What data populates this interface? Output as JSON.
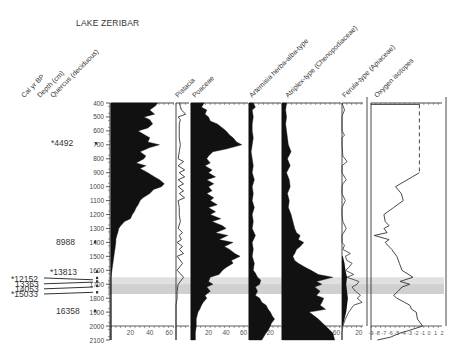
{
  "title": "LAKE ZERIBAR",
  "chart_data": {
    "type": "area",
    "title": "LAKE ZERIBAR",
    "subtitle": "Pollen percentage diagram with oxygen isotopes",
    "y_axis": {
      "label": "Depth (cm)",
      "range": [
        400,
        2100
      ],
      "ticks": [
        400,
        500,
        600,
        700,
        800,
        900,
        1000,
        1100,
        1200,
        1300,
        1400,
        1500,
        1600,
        1700,
        1800,
        1900,
        2000,
        2100
      ],
      "inverted": true
    },
    "age_axis": {
      "label": "Cal yr BP",
      "dates": [
        {
          "label": "*4492",
          "depth": 690
        },
        {
          "label": "8988",
          "depth": 1395
        },
        {
          "label": "*13813",
          "depth": 1610
        },
        {
          "label": "*12152",
          "depth": 1660
        },
        {
          "label": "13363",
          "depth": 1690
        },
        {
          "label": "14053",
          "depth": 1735
        },
        {
          "label": "*15033",
          "depth": 1790
        },
        {
          "label": "16358",
          "depth": 1890
        }
      ]
    },
    "highlight_band": {
      "depth_from": 1650,
      "depth_to": 1770,
      "color": "#d8d8d8"
    },
    "series": [
      {
        "name": "Quercus (deciduous)",
        "kind": "silhouette",
        "xlim": [
          0,
          65
        ],
        "xticks": [
          20,
          40,
          60
        ],
        "depth": [
          400,
          420,
          450,
          480,
          500,
          520,
          550,
          580,
          600,
          630,
          650,
          680,
          700,
          720,
          750,
          780,
          800,
          830,
          850,
          870,
          900,
          930,
          950,
          980,
          1000,
          1020,
          1050,
          1080,
          1100,
          1130,
          1150,
          1180,
          1200,
          1230,
          1250,
          1280,
          1300,
          1330,
          1350,
          1380,
          1400,
          1450,
          1500,
          1550,
          1600,
          1650,
          1700,
          1750,
          1800,
          1850,
          1900,
          1950,
          2000,
          2050,
          2100
        ],
        "values": [
          48,
          46,
          40,
          45,
          34,
          40,
          43,
          38,
          28,
          35,
          40,
          38,
          50,
          40,
          30,
          36,
          34,
          26,
          36,
          30,
          38,
          45,
          50,
          55,
          52,
          44,
          40,
          33,
          30,
          28,
          26,
          24,
          22,
          20,
          14,
          10,
          8,
          7,
          6,
          5,
          5,
          4,
          3,
          2,
          1,
          0,
          0,
          0,
          0,
          0,
          0,
          0,
          0,
          0,
          0
        ]
      },
      {
        "name": "Pistacia",
        "kind": "line",
        "xlim": [
          0,
          12
        ],
        "depth": [
          400,
          450,
          480,
          500,
          520,
          550,
          600,
          650,
          700,
          750,
          800,
          820,
          850,
          880,
          900,
          930,
          950,
          980,
          1000,
          1030,
          1050,
          1080,
          1100,
          1150,
          1200,
          1250,
          1300,
          1330,
          1350,
          1380,
          1400,
          1430,
          1450,
          1480,
          1500,
          1550,
          1600,
          1650,
          1700,
          1750,
          1800,
          1850,
          1900,
          1950,
          2000,
          2100
        ],
        "values": [
          3,
          5,
          9,
          2,
          4,
          3,
          3,
          3,
          4,
          3,
          2,
          7,
          2,
          8,
          3,
          8,
          2,
          7,
          2,
          7,
          3,
          8,
          2,
          3,
          3,
          4,
          2,
          6,
          3,
          5,
          1,
          6,
          3,
          7,
          1,
          6,
          1,
          7,
          2,
          1,
          1,
          0,
          0,
          0,
          0,
          0
        ]
      },
      {
        "name": "Poaceae",
        "kind": "silhouette",
        "xlim": [
          0,
          65
        ],
        "xticks": [
          20,
          40,
          60
        ],
        "depth": [
          400,
          430,
          450,
          480,
          500,
          530,
          550,
          580,
          600,
          630,
          650,
          680,
          700,
          730,
          750,
          780,
          800,
          830,
          850,
          880,
          900,
          930,
          950,
          980,
          1000,
          1030,
          1050,
          1080,
          1100,
          1130,
          1150,
          1180,
          1200,
          1230,
          1250,
          1280,
          1300,
          1330,
          1350,
          1380,
          1400,
          1430,
          1450,
          1480,
          1500,
          1530,
          1550,
          1580,
          1600,
          1630,
          1650,
          1680,
          1700,
          1720,
          1750,
          1780,
          1800,
          1830,
          1850,
          1880,
          1900,
          1950,
          2000,
          2050,
          2100
        ],
        "values": [
          15,
          12,
          18,
          16,
          20,
          22,
          30,
          36,
          40,
          44,
          48,
          52,
          58,
          40,
          25,
          20,
          18,
          22,
          16,
          24,
          20,
          28,
          18,
          26,
          20,
          24,
          18,
          26,
          22,
          30,
          20,
          28,
          22,
          34,
          24,
          36,
          40,
          28,
          42,
          32,
          48,
          38,
          44,
          50,
          56,
          46,
          48,
          40,
          36,
          32,
          22,
          20,
          25,
          18,
          22,
          16,
          18,
          14,
          12,
          10,
          8,
          6,
          6,
          5,
          5
        ]
      },
      {
        "name": "Artemisia herba-alba-type",
        "kind": "silhouette",
        "xlim": [
          0,
          30
        ],
        "xticks": [
          20
        ],
        "depth": [
          400,
          430,
          450,
          500,
          550,
          600,
          650,
          700,
          750,
          800,
          850,
          900,
          950,
          1000,
          1050,
          1100,
          1150,
          1200,
          1250,
          1300,
          1350,
          1400,
          1450,
          1500,
          1550,
          1600,
          1620,
          1650,
          1670,
          1700,
          1720,
          1750,
          1780,
          1800,
          1830,
          1850,
          1880,
          1900,
          1930,
          1950,
          1980,
          2000,
          2030,
          2050,
          2100
        ],
        "values": [
          4,
          6,
          3,
          4,
          3,
          3,
          4,
          3,
          2,
          3,
          4,
          3,
          5,
          3,
          4,
          3,
          5,
          3,
          4,
          3,
          6,
          3,
          4,
          3,
          5,
          4,
          6,
          8,
          11,
          10,
          6,
          8,
          6,
          10,
          12,
          16,
          18,
          20,
          22,
          24,
          21,
          20,
          18,
          16,
          12
        ]
      },
      {
        "name": "Atriplex-type (Chenopodiaceae)",
        "kind": "silhouette",
        "xlim": [
          0,
          65
        ],
        "xticks": [
          20,
          40,
          60
        ],
        "depth": [
          400,
          450,
          500,
          550,
          600,
          650,
          700,
          750,
          800,
          850,
          900,
          950,
          1000,
          1050,
          1100,
          1150,
          1200,
          1250,
          1300,
          1330,
          1350,
          1380,
          1400,
          1430,
          1450,
          1480,
          1500,
          1530,
          1550,
          1580,
          1600,
          1630,
          1650,
          1680,
          1700,
          1720,
          1750,
          1780,
          1800,
          1830,
          1850,
          1880,
          1900,
          1950,
          2000,
          2050,
          2100
        ],
        "values": [
          5,
          4,
          5,
          4,
          5,
          6,
          7,
          10,
          6,
          9,
          5,
          8,
          9,
          6,
          8,
          7,
          10,
          12,
          14,
          16,
          20,
          18,
          24,
          20,
          16,
          14,
          12,
          14,
          18,
          26,
          32,
          40,
          56,
          38,
          44,
          36,
          42,
          38,
          46,
          44,
          42,
          48,
          30,
          40,
          48,
          56,
          58
        ]
      },
      {
        "name": "Ferula-type (Apiaceae)",
        "kind": "mixed",
        "xlim": [
          0,
          25
        ],
        "xticks": [
          20
        ],
        "line_depth": [
          400,
          450,
          480,
          500,
          600,
          630,
          650,
          700,
          780,
          820,
          850,
          900,
          950,
          980,
          1000,
          1050,
          1100,
          1150,
          1200,
          1250,
          1300,
          1350,
          1400,
          1420,
          1450,
          1480,
          1500,
          1530,
          1550,
          1580,
          1600,
          1630,
          1650,
          1680,
          1700,
          1720,
          1750,
          1780,
          1800,
          1830,
          1850,
          1900,
          1950,
          2000,
          2050,
          2100
        ],
        "line_values": [
          0,
          3,
          1,
          0,
          0,
          3,
          0,
          0,
          1,
          6,
          0,
          0,
          5,
          1,
          0,
          0,
          4,
          0,
          0,
          1,
          5,
          0,
          0,
          3,
          1,
          10,
          4,
          6,
          12,
          8,
          4,
          14,
          6,
          20,
          18,
          12,
          16,
          22,
          18,
          24,
          14,
          8,
          4,
          1,
          0,
          0
        ],
        "fill_depth": [
          1500,
          1550,
          1600,
          1650,
          1700,
          1750,
          1800,
          1850,
          1900,
          1950,
          2000
        ],
        "fill_values": [
          1,
          3,
          4,
          6,
          5,
          6,
          7,
          6,
          5,
          3,
          1
        ]
      },
      {
        "name": "Oxygen isotopes",
        "kind": "line",
        "xlim": [
          -9,
          2
        ],
        "xticks": [
          -9,
          -8,
          -7,
          -6,
          -5,
          -4,
          -3,
          -2,
          -1,
          0,
          1,
          2
        ],
        "xtick_labels": [
          "-9",
          "-8",
          "-7",
          "-6",
          "-5",
          "-4",
          "-3",
          "-2",
          "-1",
          "0",
          "1",
          "2"
        ],
        "dashed_segment": {
          "depth": [
            410,
            900
          ],
          "value": -1.5
        },
        "depth": [
          900,
          1000,
          1050,
          1100,
          1150,
          1200,
          1250,
          1280,
          1300,
          1330,
          1350,
          1380,
          1400,
          1450,
          1500,
          1550,
          1600,
          1650,
          1680,
          1700,
          1720,
          1750,
          1780,
          1800,
          1830,
          1850,
          1880,
          1900,
          1950,
          2000,
          2030,
          2050,
          2080,
          2100
        ],
        "values": [
          -1.5,
          -5.2,
          -4.3,
          -4.0,
          -5.5,
          -7.0,
          -6.8,
          -6.2,
          -7.0,
          -6.5,
          -8.5,
          -6.2,
          -6.8,
          -5.8,
          -5.0,
          -4.6,
          -4.2,
          -2.5,
          -4.5,
          -3.0,
          -4.2,
          -4.8,
          -5.5,
          -5.0,
          -3.8,
          -3.0,
          -2.7,
          -2.0,
          -1.8,
          -1.0,
          -3.0,
          -4.5,
          -6.0,
          -8.0
        ]
      }
    ],
    "grid": false,
    "legend": "column headers, rotated 45°"
  },
  "axis_labels": {
    "age": "Cal yr BP",
    "depth": "Depth (cm)"
  },
  "column_headers": [
    "Cal yr BP",
    "Depth (cm)",
    "Quercus (deciduous)",
    "Pistacia",
    "Poaceae",
    "Artemisia herba-alba-type",
    "Atriplex-type (Chenopodiaceae)",
    "Ferula-type (Apiaceae)",
    "Oxygen isotopes"
  ]
}
